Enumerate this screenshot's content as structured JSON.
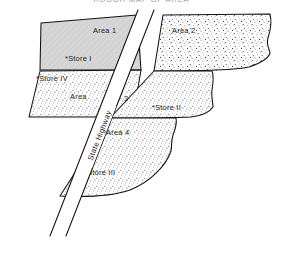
{
  "title": "ROUGH MAP OF AREA",
  "map": {
    "road": {
      "label": "State Highway",
      "name": "state-highway"
    },
    "areas": [
      {
        "id": "area-1",
        "label": "Area 1",
        "fill": "solid-gray",
        "color": "#d4d4d4"
      },
      {
        "id": "area-2",
        "label": "Area 2",
        "fill": "stipple",
        "color": "#e8e8e8"
      },
      {
        "id": "area-3-left",
        "label": "Area",
        "fill": "stipple",
        "color": "#ececec"
      },
      {
        "id": "area-3-right",
        "label": "3",
        "fill": "stipple",
        "color": "#ececec"
      },
      {
        "id": "area-4",
        "label": "Area 4",
        "fill": "stipple",
        "color": "#eaeaea"
      }
    ],
    "stores": [
      {
        "id": "store-1",
        "label": "*Store I",
        "area": "Area 1"
      },
      {
        "id": "store-2",
        "label": "*Store II",
        "area": "Area 3"
      },
      {
        "id": "store-3",
        "label": "*Store III",
        "area": "Area 4"
      },
      {
        "id": "store-4",
        "label": "*Store IV",
        "area": "Area 3"
      }
    ]
  },
  "colors": {
    "ink": "#111111",
    "paper": "#ffffff",
    "title_gray": "#9a9a9a",
    "area1_gray": "#d4d4d4"
  }
}
